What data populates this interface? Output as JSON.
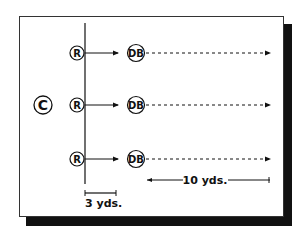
{
  "diagram": {
    "type": "football-drill",
    "coach": {
      "label": "C"
    },
    "receivers": [
      {
        "label": "R"
      },
      {
        "label": "R"
      },
      {
        "label": "R"
      }
    ],
    "defensive_backs": [
      {
        "label": "DB"
      },
      {
        "label": "DB"
      },
      {
        "label": "DB"
      }
    ],
    "measurements": {
      "short": "3 yds.",
      "long": "10 yds."
    },
    "colors": {
      "ink": "#111111",
      "background": "#ffffff",
      "shadow": "#111111"
    }
  }
}
